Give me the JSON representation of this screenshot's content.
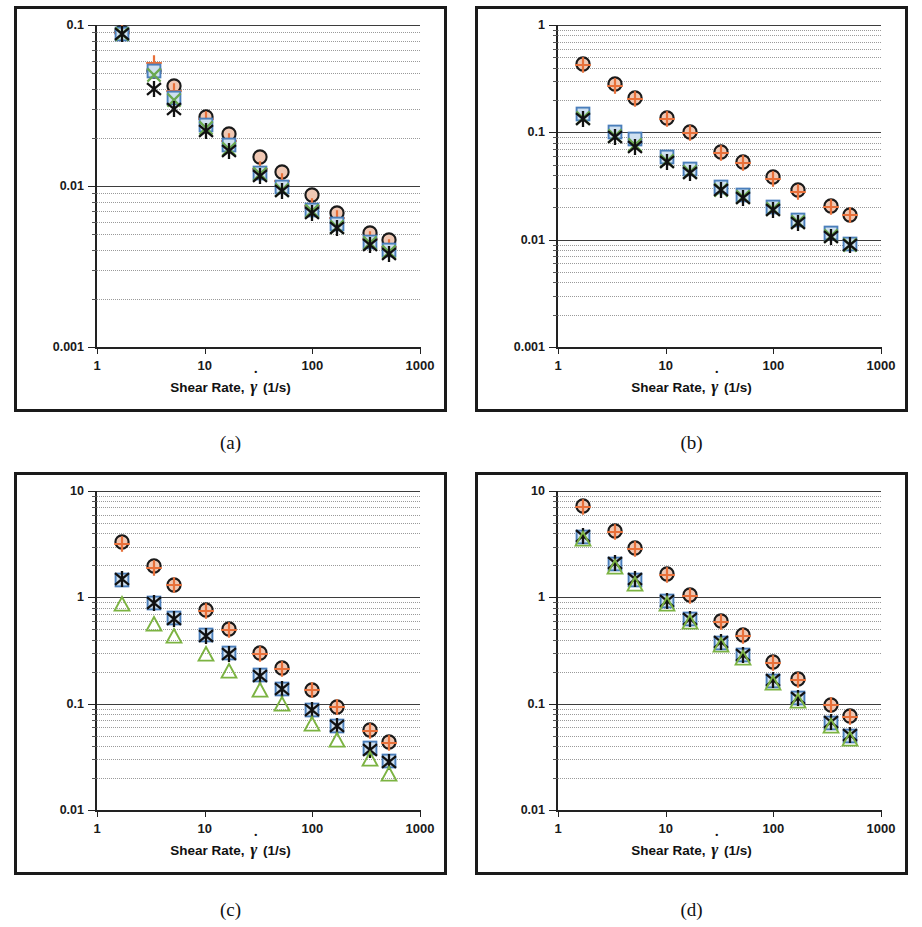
{
  "figure": {
    "panels": [
      {
        "id": "a",
        "caption": "(a)",
        "xlabel_prefix": "Shear Rate,",
        "xlabel_suffix": "(1/s)",
        "ylabel_prefix": "Apparent Viscosity,",
        "ylabel_suffix": "(Pa-s)",
        "ylabel_symbol": "η",
        "xlabel_symbol": "γ"
      },
      {
        "id": "b",
        "caption": "(b)",
        "xlabel_prefix": "Shear Rate,",
        "xlabel_suffix": "(1/s)",
        "ylabel_prefix": "Apparent Viscosity,",
        "ylabel_suffix": "(Pa-s)",
        "ylabel_symbol": "η",
        "xlabel_symbol": "γ"
      },
      {
        "id": "c",
        "caption": "(c)",
        "xlabel_prefix": "Shear Rate,",
        "xlabel_suffix": "(1/s)",
        "ylabel_prefix": "Apparent Viscosity,",
        "ylabel_suffix": "(Pa-s)",
        "ylabel_symbol": "η",
        "xlabel_symbol": "γ"
      },
      {
        "id": "d",
        "caption": "(d)",
        "xlabel_prefix": "Shear Rate,",
        "xlabel_suffix": "(1/s)",
        "ylabel_prefix": "Apparent Viscosity,",
        "ylabel_suffix": "(Pa-s)",
        "ylabel_symbol": "η",
        "xlabel_symbol": "γ"
      }
    ]
  },
  "colors": {
    "circle": "#1a1a1a",
    "circle_fill": "#f0c8b4",
    "plus": "#e8703a",
    "square": "#4a7ebb",
    "square_fill": "#cfe0f0",
    "triangle": "#7cb342",
    "asterisk": "#111111",
    "cross": "#6aa84f",
    "grid_major": "#3d3d3d",
    "grid_minor": "#9a9a9a",
    "axis": "#222222",
    "frame": "#1a1a1a"
  },
  "chart_data": [
    {
      "type": "scatter",
      "panel": "a",
      "title": "(a)",
      "xlabel": "Shear Rate, γ̇ (1/s)",
      "ylabel": "Apparent Viscosity, η (Pa-s)",
      "xscale": "log",
      "yscale": "log",
      "xlim": [
        1,
        1000
      ],
      "ylim": [
        0.001,
        0.1
      ],
      "xticks": [
        1,
        10,
        100,
        1000
      ],
      "yticks": [
        0.001,
        0.01,
        0.1
      ],
      "xtick_labels": [
        "1",
        "10",
        "100",
        "1000"
      ],
      "ytick_labels": [
        "0.001",
        "0.01",
        "0.1"
      ],
      "grid": "minor-horizontal-dotted, major-horizontal-solid",
      "legend": "none",
      "x": [
        1.7,
        3.4,
        5.2,
        10.3,
        17.0,
        33.0,
        52.0,
        100.0,
        170.0,
        340.0,
        520.0
      ],
      "series": [
        {
          "name": "circle",
          "marker": "open-circle",
          "values": [
            0.09,
            0.052,
            0.042,
            0.027,
            0.021,
            0.0152,
            0.0122,
            0.0088,
            0.0068,
            0.0051,
            0.0046
          ]
        },
        {
          "name": "plus",
          "marker": "plus",
          "values": [
            0.089,
            0.058,
            0.039,
            0.026,
            0.019,
            0.0128,
            0.0108,
            0.0075,
            0.0063,
            0.0047,
            0.0042
          ]
        },
        {
          "name": "square",
          "marker": "open-square",
          "values": [
            0.088,
            0.052,
            0.035,
            0.024,
            0.018,
            0.012,
            0.0098,
            0.0071,
            0.0058,
            0.0045,
            0.004
          ]
        },
        {
          "name": "cross",
          "marker": "x-cross",
          "values": [
            0.088,
            0.049,
            0.034,
            0.023,
            0.017,
            0.0118,
            0.0095,
            0.007,
            0.0056,
            0.0044,
            0.0039
          ]
        },
        {
          "name": "star",
          "marker": "asterisk",
          "values": [
            0.088,
            0.04,
            0.03,
            0.022,
            0.0165,
            0.0115,
            0.0093,
            0.0068,
            0.0055,
            0.0043,
            0.0038
          ]
        }
      ]
    },
    {
      "type": "scatter",
      "panel": "b",
      "title": "(b)",
      "xlabel": "Shear Rate, γ̇ (1/s)",
      "ylabel": "Apparent Viscosity, η (Pa-s)",
      "xscale": "log",
      "yscale": "log",
      "xlim": [
        1,
        1000
      ],
      "ylim": [
        0.001,
        1
      ],
      "xticks": [
        1,
        10,
        100,
        1000
      ],
      "yticks": [
        0.001,
        0.01,
        0.1,
        1
      ],
      "xtick_labels": [
        "1",
        "10",
        "100",
        "1000"
      ],
      "ytick_labels": [
        "0.001",
        "0.01",
        "0.1",
        "1"
      ],
      "grid": "minor-horizontal-dotted, major-horizontal-solid",
      "legend": "none",
      "x": [
        1.7,
        3.4,
        5.2,
        10.3,
        17.0,
        33.0,
        52.0,
        100.0,
        170.0,
        340.0,
        520.0
      ],
      "series": [
        {
          "name": "circle",
          "marker": "open-circle",
          "values": [
            0.43,
            0.28,
            0.21,
            0.135,
            0.1,
            0.066,
            0.053,
            0.038,
            0.029,
            0.0205,
            0.017
          ]
        },
        {
          "name": "plus",
          "marker": "plus",
          "values": [
            0.42,
            0.27,
            0.205,
            0.132,
            0.099,
            0.064,
            0.052,
            0.037,
            0.028,
            0.02,
            0.0168
          ]
        },
        {
          "name": "square",
          "marker": "open-square",
          "values": [
            0.148,
            0.1,
            0.087,
            0.059,
            0.046,
            0.031,
            0.026,
            0.02,
            0.0152,
            0.0115,
            0.0092
          ]
        },
        {
          "name": "cross",
          "marker": "x-cross",
          "values": [
            0.135,
            0.092,
            0.076,
            0.054,
            0.043,
            0.029,
            0.025,
            0.0192,
            0.0146,
            0.0108,
            0.009
          ]
        },
        {
          "name": "star",
          "marker": "asterisk",
          "values": [
            0.133,
            0.09,
            0.073,
            0.053,
            0.042,
            0.029,
            0.0245,
            0.019,
            0.0144,
            0.0107,
            0.0089
          ]
        }
      ]
    },
    {
      "type": "scatter",
      "panel": "c",
      "title": "(c)",
      "xlabel": "Shear Rate, γ̇ (1/s)",
      "ylabel": "Apparent Viscosity, η (Pa-s)",
      "xscale": "log",
      "yscale": "log",
      "xlim": [
        1,
        1000
      ],
      "ylim": [
        0.01,
        10
      ],
      "xticks": [
        1,
        10,
        100,
        1000
      ],
      "yticks": [
        0.01,
        0.1,
        1,
        10
      ],
      "xtick_labels": [
        "1",
        "10",
        "100",
        "1000"
      ],
      "ytick_labels": [
        "0.01",
        "0.1",
        "1",
        "10"
      ],
      "grid": "minor-horizontal-dotted, major-horizontal-solid",
      "legend": "none",
      "x": [
        1.7,
        3.4,
        5.2,
        10.3,
        17.0,
        33.0,
        52.0,
        100.0,
        170.0,
        340.0,
        520.0
      ],
      "series": [
        {
          "name": "circle",
          "marker": "open-circle",
          "values": [
            3.3,
            1.95,
            1.32,
            0.76,
            0.5,
            0.3,
            0.215,
            0.135,
            0.094,
            0.056,
            0.044
          ]
        },
        {
          "name": "plus",
          "marker": "plus",
          "values": [
            3.2,
            1.9,
            1.3,
            0.75,
            0.49,
            0.295,
            0.212,
            0.133,
            0.093,
            0.055,
            0.043
          ]
        },
        {
          "name": "square",
          "marker": "open-square",
          "values": [
            1.45,
            0.88,
            0.64,
            0.44,
            0.3,
            0.185,
            0.138,
            0.088,
            0.062,
            0.038,
            0.029
          ]
        },
        {
          "name": "star",
          "marker": "asterisk",
          "values": [
            1.48,
            0.88,
            0.63,
            0.43,
            0.295,
            0.182,
            0.136,
            0.087,
            0.061,
            0.037,
            0.028
          ]
        },
        {
          "name": "triangle",
          "marker": "open-triangle",
          "values": [
            0.86,
            0.56,
            0.43,
            0.29,
            0.205,
            0.135,
            0.1,
            0.064,
            0.046,
            0.03,
            0.022
          ]
        }
      ]
    },
    {
      "type": "scatter",
      "panel": "d",
      "title": "(d)",
      "xlabel": "Shear Rate, γ̇ (1/s)",
      "ylabel": "Apparent Viscosity, η (Pa-s)",
      "xscale": "log",
      "yscale": "log",
      "xlim": [
        1,
        1000
      ],
      "ylim": [
        0.01,
        10
      ],
      "xticks": [
        1,
        10,
        100,
        1000
      ],
      "yticks": [
        0.01,
        0.1,
        1,
        10
      ],
      "xtick_labels": [
        "1",
        "10",
        "100",
        "1000"
      ],
      "ytick_labels": [
        "0.01",
        "0.1",
        "1",
        "10"
      ],
      "grid": "minor-horizontal-dotted, major-horizontal-solid",
      "legend": "none",
      "x": [
        1.7,
        3.4,
        5.2,
        10.3,
        17.0,
        33.0,
        52.0,
        100.0,
        170.0,
        340.0,
        520.0
      ],
      "series": [
        {
          "name": "circle",
          "marker": "open-circle",
          "values": [
            7.3,
            4.2,
            2.9,
            1.65,
            1.05,
            0.6,
            0.44,
            0.245,
            0.17,
            0.098,
            0.076
          ]
        },
        {
          "name": "plus",
          "marker": "plus",
          "values": [
            7.1,
            4.1,
            2.85,
            1.62,
            1.03,
            0.59,
            0.435,
            0.242,
            0.168,
            0.097,
            0.075
          ]
        },
        {
          "name": "square",
          "marker": "open-square",
          "values": [
            3.7,
            2.05,
            1.45,
            0.92,
            0.62,
            0.375,
            0.285,
            0.165,
            0.112,
            0.066,
            0.05
          ]
        },
        {
          "name": "star",
          "marker": "asterisk",
          "values": [
            3.8,
            2.1,
            1.48,
            0.93,
            0.625,
            0.38,
            0.288,
            0.167,
            0.113,
            0.067,
            0.051
          ]
        },
        {
          "name": "triangle",
          "marker": "open-triangle",
          "values": [
            3.5,
            1.92,
            1.34,
            0.86,
            0.59,
            0.355,
            0.268,
            0.158,
            0.106,
            0.062,
            0.047
          ]
        }
      ]
    }
  ]
}
